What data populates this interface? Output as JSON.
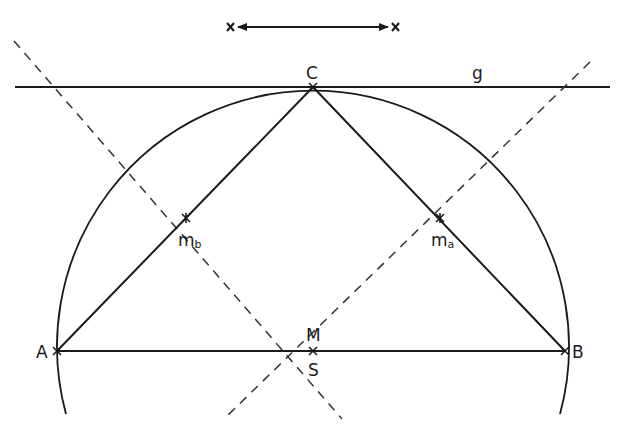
{
  "diagram": {
    "points": {
      "A": {
        "label": "A",
        "x": 57,
        "y": 351
      },
      "B": {
        "label": "B",
        "x": 565,
        "y": 351
      },
      "C": {
        "label": "C",
        "x": 313,
        "y": 87
      },
      "M": {
        "label": "M",
        "x": 313,
        "y": 351
      },
      "S": {
        "label": "S",
        "x": 313,
        "y": 351
      },
      "mb": {
        "label": "m",
        "sub": "b",
        "x": 186,
        "y": 218
      },
      "ma": {
        "label": "m",
        "sub": "a",
        "x": 440,
        "y": 218
      }
    },
    "line_g": {
      "label": "g"
    },
    "labels": {
      "A": "A",
      "B": "B",
      "C": "C",
      "M": "M",
      "S": "S",
      "mb_main": "m",
      "mb_sub": "b",
      "ma_main": "m",
      "ma_sub": "a",
      "g": "g"
    },
    "distance_marker": {
      "description": "double-headed arrow between two crosses",
      "x1": 230,
      "x2": 396,
      "y": 27
    },
    "colors": {
      "stroke": "#1a1a1a",
      "background": "#ffffff"
    }
  }
}
